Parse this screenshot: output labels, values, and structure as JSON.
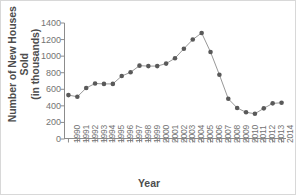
{
  "chart_data": {
    "type": "line",
    "title": "",
    "xlabel": "Year",
    "ylabel": "Number of New Houses Sold\n(in thousands)",
    "categories": [
      "1990",
      "1991",
      "1992",
      "1993",
      "1994",
      "1995",
      "1996",
      "1997",
      "1998",
      "1999",
      "2000",
      "2001",
      "2002",
      "2003",
      "2004",
      "2005",
      "2006",
      "2007",
      "2008",
      "2009",
      "2010",
      "2011",
      "2012",
      "2013",
      "2014"
    ],
    "values": [
      530,
      510,
      615,
      670,
      665,
      665,
      760,
      805,
      885,
      880,
      880,
      910,
      975,
      1090,
      1200,
      1280,
      1050,
      775,
      485,
      375,
      322,
      305,
      370,
      430,
      437
    ],
    "ytick_labels": [
      "1400",
      "1200",
      "1000",
      "800",
      "600",
      "400",
      "200",
      "0"
    ],
    "ytick_values": [
      1400,
      1200,
      1000,
      800,
      600,
      400,
      200,
      0
    ],
    "ylim": [
      0,
      1400
    ],
    "grid": false,
    "legend": "none",
    "marker": "circle",
    "series_color": "#595959",
    "line_color": "#8c8c8c",
    "axis_color": "#8c8c8c"
  }
}
